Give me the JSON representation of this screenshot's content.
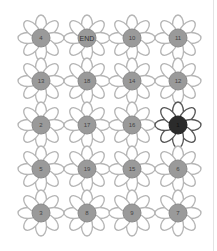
{
  "puzzle": {
    "rows": [
      [
        {
          "label": "4"
        },
        {
          "label": "END",
          "type": "end"
        },
        {
          "label": "10"
        },
        {
          "label": "11"
        }
      ],
      [
        {
          "label": "13"
        },
        {
          "label": "18"
        },
        {
          "label": "14"
        },
        {
          "label": "12"
        }
      ],
      [
        {
          "label": "2"
        },
        {
          "label": "17"
        },
        {
          "label": "16"
        },
        {
          "label": "1",
          "type": "start"
        }
      ],
      [
        {
          "label": "5"
        },
        {
          "label": "19"
        },
        {
          "label": "15"
        },
        {
          "label": "6"
        }
      ],
      [
        {
          "label": "3"
        },
        {
          "label": "8"
        },
        {
          "label": "9"
        },
        {
          "label": "7"
        }
      ]
    ]
  },
  "colors": {
    "petal_stroke": "#b5b5b5",
    "petal_stroke_dark": "#555555",
    "center_fill": "#9a9a9a",
    "center_fill_dark": "#2b2b2b",
    "center_stroke": "#8a8a8a"
  }
}
